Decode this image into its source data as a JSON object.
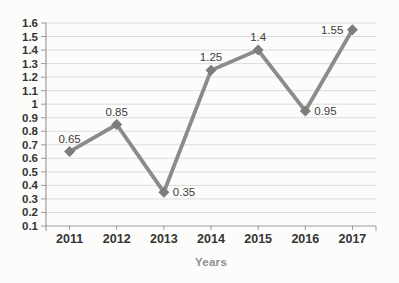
{
  "page": {
    "background": "#fcfcfa"
  },
  "chart_data": {
    "type": "line",
    "title": "",
    "xlabel": "Years",
    "ylabel": "",
    "categories": [
      "2011",
      "2012",
      "2013",
      "2014",
      "2015",
      "2016",
      "2017"
    ],
    "series": [
      {
        "name": "",
        "values": [
          0.65,
          0.85,
          0.35,
          1.25,
          1.4,
          0.95,
          1.55
        ]
      }
    ],
    "data_labels": [
      "0.65",
      "0.85",
      "0.35",
      "1.25",
      "1.4",
      "0.95",
      "1.55"
    ],
    "label_positions": [
      "above",
      "above",
      "right",
      "above",
      "above",
      "right",
      "left"
    ],
    "y_ticks": [
      "1.6",
      "1.5",
      "1.4",
      "1.3",
      "1.2",
      "1.1",
      "1",
      "0.9",
      "0.8",
      "0.7",
      "0.6",
      "0.5",
      "0.4",
      "0.3",
      "0.2",
      "0.1"
    ],
    "ylim": [
      0.1,
      1.6
    ],
    "grid": true,
    "legend": false,
    "marker": "diamond",
    "colors": {
      "line": "#8b8b8b",
      "marker": "#7c7c7c",
      "grid": "#dcdcdd",
      "axis": "#9b9b9b",
      "tick_text": "#343434",
      "data_label": "#3c3c3c",
      "axis_title": "#8f8f8f",
      "background": "#fcfcfa"
    }
  }
}
